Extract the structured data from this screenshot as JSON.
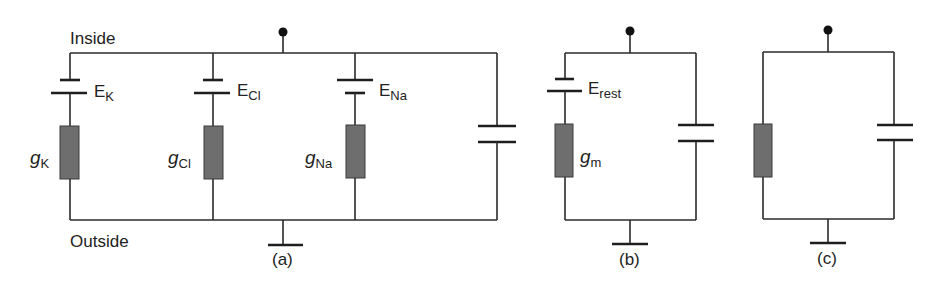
{
  "figure": {
    "labels": {
      "inside": "Inside",
      "outside": "Outside"
    },
    "panels": [
      {
        "id": "a",
        "caption": "(a)",
        "batteries": [
          {
            "symbol": "E",
            "sub": "K"
          },
          {
            "symbol": "E",
            "sub": "Cl"
          },
          {
            "symbol": "E",
            "sub": "Na"
          }
        ],
        "conductances": [
          {
            "symbol": "g",
            "sub": "K"
          },
          {
            "symbol": "g",
            "sub": "Cl"
          },
          {
            "symbol": "g",
            "sub": "Na"
          }
        ],
        "capacitor": "membrane capacitor"
      },
      {
        "id": "b",
        "caption": "(b)",
        "batteries": [
          {
            "symbol": "E",
            "sub": "rest"
          }
        ],
        "conductances": [
          {
            "symbol": "g",
            "sub": "m"
          }
        ],
        "capacitor": "membrane capacitor"
      },
      {
        "id": "c",
        "caption": "(c)",
        "batteries": [],
        "conductances": [],
        "capacitor": "membrane capacitor"
      }
    ],
    "colors": {
      "wire": "#2a2a2a",
      "resistor_fill": "#6e6e6e",
      "background": "#ffffff"
    }
  }
}
